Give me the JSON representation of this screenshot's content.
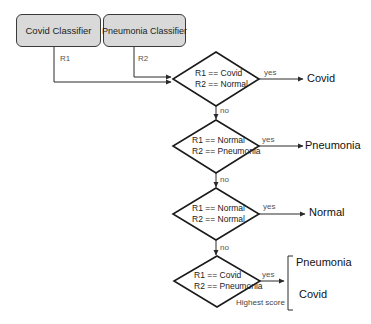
{
  "diagram": {
    "nodes": {
      "covid_classifier": {
        "label": "Covid Classifier"
      },
      "pneumonia_classifier": {
        "label": "Pneumonia Classifier"
      }
    },
    "edges": {
      "r1": "R1",
      "r2": "R2",
      "yes": "yes",
      "no": "no"
    },
    "decisions": [
      {
        "line1": "R1 == Covid",
        "line2": "R2 == Normal",
        "yes_output": "Covid"
      },
      {
        "line1": "R1 == Normal",
        "line2": "R2 == Pneumonia",
        "yes_output": "Pneumonia"
      },
      {
        "line1": "R1 == Normal",
        "line2": "R2 == Normal",
        "yes_output": "Normal"
      },
      {
        "line1": "R1 == Covid",
        "line2": "R2 == Pneumonia",
        "yes_outputs": [
          "Pneumonia",
          "Covid"
        ],
        "note": "Highest score"
      }
    ]
  },
  "colors": {
    "box_fill": "#d9d9d9",
    "stroke": "#2a2a2a"
  }
}
